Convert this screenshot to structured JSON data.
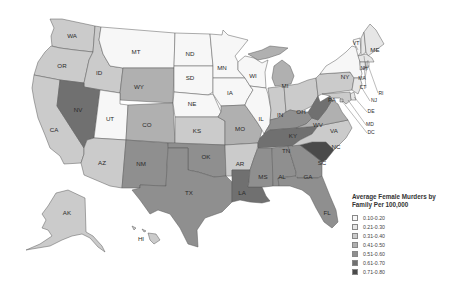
{
  "legend": {
    "title": "Average Female Murders by Family Per 100,000",
    "bins": [
      {
        "label": "0.10-0.20",
        "color": "#f7f7f7"
      },
      {
        "label": "0.21-0.30",
        "color": "#e6e6e6"
      },
      {
        "label": "0.31-0.40",
        "color": "#cbcbcb"
      },
      {
        "label": "0.41-0.50",
        "color": "#b0b0b0"
      },
      {
        "label": "0.51-0.60",
        "color": "#8f8f8f"
      },
      {
        "label": "0.61-0.70",
        "color": "#707070"
      },
      {
        "label": "0.71-0.80",
        "color": "#4a4a4a"
      }
    ]
  },
  "states": {
    "WA": 2,
    "OR": 2,
    "CA": 2,
    "ID": 2,
    "NV": 5,
    "MT": 0,
    "WY": 3,
    "UT": 0,
    "CO": 3,
    "AZ": 2,
    "NM": 4,
    "ND": 0,
    "SD": 0,
    "NE": 0,
    "KS": 2,
    "OK": 4,
    "TX": 4,
    "MN": 0,
    "IA": 0,
    "MO": 3,
    "AR": 2,
    "LA": 5,
    "WI": 0,
    "IL": 0,
    "MI": 3,
    "IN": 2,
    "OH": 2,
    "KY": 4,
    "TN": 5,
    "MS": 4,
    "AL": 4,
    "GA": 4,
    "FL": 4,
    "SC": 6,
    "NC": 2,
    "VA": 3,
    "WV": 5,
    "PA": 2,
    "NY": 0,
    "VT": 0,
    "NH": 1,
    "ME": 1,
    "MA": 1,
    "RI": 0,
    "CT": 1,
    "NJ": 1,
    "DE": 1,
    "MD": 2,
    "DC": 2,
    "AK": 2,
    "HI": 2
  },
  "labels": {
    "WA": "WA",
    "OR": "OR",
    "CA": "CA",
    "ID": "ID",
    "NV": "NV",
    "MT": "MT",
    "WY": "WY",
    "UT": "UT",
    "CO": "CO",
    "AZ": "AZ",
    "NM": "NM",
    "ND": "ND",
    "SD": "SD",
    "NE": "NE",
    "KS": "KS",
    "OK": "OK",
    "TX": "TX",
    "MN": "MN",
    "IA": "IA",
    "MO": "MO",
    "AR": "AR",
    "LA": "LA",
    "WI": "WI",
    "IL": "IL",
    "MI": "MI",
    "IN": "IN",
    "OH": "OH",
    "KY": "KY",
    "TN": "TN",
    "MS": "MS",
    "AL": "AL",
    "GA": "GA",
    "FL": "FL",
    "SC": "SC",
    "NC": "NC",
    "VA": "VA",
    "WV": "WV",
    "PA": "PA",
    "NY": "NY",
    "VT": "VT",
    "NH": "NH",
    "ME": "ME",
    "MA": "MA",
    "RI": "RI",
    "CT": "CT",
    "NJ": "NJ",
    "DE": "DE",
    "MD": "MD",
    "DC": "DC",
    "AK": "AK",
    "HI": "HI"
  }
}
